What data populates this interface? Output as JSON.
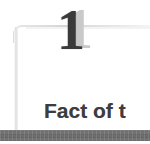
{
  "page": {
    "background_color": "#ffffff",
    "width": 150,
    "height": 144
  },
  "chapter_number": {
    "value": "1",
    "shadow_value": "1",
    "color": "#3a3a3a",
    "shadow_color": "#c9c9c9"
  },
  "heading": {
    "text": "Fact of t",
    "color": "#3d3d3d"
  },
  "rule": {
    "color": "#6f6f6f"
  },
  "frame": {
    "color": "#dcdcdc"
  }
}
